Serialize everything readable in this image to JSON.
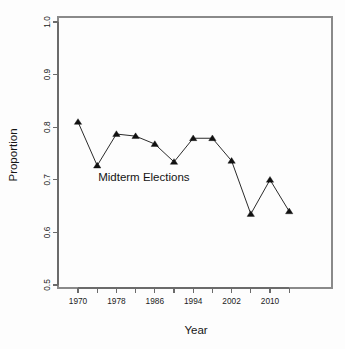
{
  "figure": {
    "background_color": "#fdfdfd",
    "plot_box": {
      "left": 58,
      "right": 332,
      "top": 17,
      "bottom": 288
    },
    "line_color": "#2b2b2b",
    "marker_color": "#111111",
    "axis_color": "#6b6b6b"
  },
  "chart_data": {
    "type": "line",
    "title": "",
    "xlabel": "Year",
    "ylabel": "Proportion",
    "xlim": [
      1968,
      2016
    ],
    "ylim": [
      0.5,
      1.0
    ],
    "grid": false,
    "legend": null,
    "marker": "triangle",
    "x": [
      1970,
      1974,
      1978,
      1982,
      1986,
      1990,
      1994,
      1998,
      2002,
      2006,
      2010,
      2014
    ],
    "values": [
      0.81,
      0.727,
      0.787,
      0.783,
      0.768,
      0.734,
      0.779,
      0.779,
      0.736,
      0.635,
      0.7,
      0.64
    ],
    "xticks": [
      1970,
      1978,
      1986,
      1994,
      2002,
      2010
    ],
    "xtick_labels": [
      "1970",
      "1978",
      "1986",
      "1994",
      "2002",
      "2010"
    ],
    "xtick_minor": [
      1974,
      1982,
      1990,
      1998,
      2006,
      2014
    ],
    "yticks": [
      0.5,
      0.6,
      0.7,
      0.8,
      0.9,
      1.0
    ],
    "ytick_labels": [
      "0.5",
      "0.6",
      "0.7",
      "0.8",
      "0.9",
      "1.0"
    ],
    "annotations": [
      {
        "text": "Midterm Elections",
        "x": 1974.2,
        "y": 0.697
      }
    ]
  }
}
